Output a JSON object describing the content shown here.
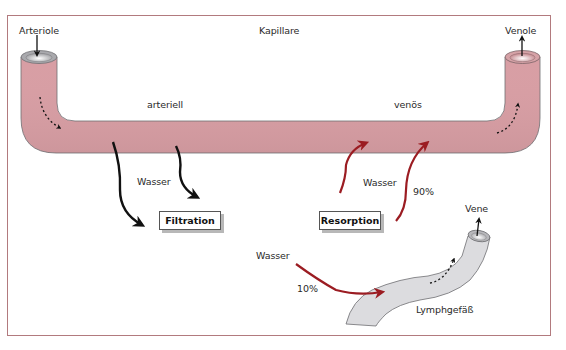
{
  "diagram": {
    "labels": {
      "arteriole": "Arteriole",
      "kapillare": "Kapillare",
      "venole": "Venole",
      "arteriell": "arteriell",
      "venoes": "venös",
      "wasser_filtration": "Wasser",
      "wasser_resorption": "Wasser",
      "percent_resorption": "90%",
      "vene": "Vene",
      "wasser_lymph": "Wasser",
      "percent_lymph": "10%",
      "lymphgefaess": "Lymphgefäß"
    },
    "boxes": {
      "filtration": "Filtration",
      "resorption": "Resorption"
    },
    "colors": {
      "frame_border": "#b27a7e",
      "capillary_arterial": "#b9b9bd",
      "capillary_venous": "#d9a3a8",
      "lymph_vessel": "#dcdcdf",
      "filtration_arrow": "#111111",
      "resorption_arrow": "#9b1c22"
    }
  }
}
